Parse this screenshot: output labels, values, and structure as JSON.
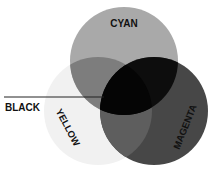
{
  "diagram": {
    "type": "venn",
    "labels": {
      "cyan": "CYAN",
      "yellow": "YELLOW",
      "magenta": "MAGENTA",
      "black": "BLACK"
    },
    "colors": {
      "cyan_only": "#a9a9a9",
      "yellow_only": "#f1f1f1",
      "magenta_only": "#474747",
      "cyan_yellow": "#7d7d7d",
      "magenta_yellow": "#5e5e5e",
      "cyan_magenta": "#0d0d0d",
      "center": "#050505",
      "leader_line": "#222222"
    }
  }
}
